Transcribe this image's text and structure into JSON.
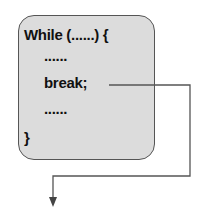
{
  "diagram": {
    "code_lines": [
      "While (......) {",
      "......",
      "break;",
      "......",
      "}"
    ],
    "colors": {
      "box_fill": "#dcdcdc",
      "box_border": "#555555",
      "arrow": "#555555"
    },
    "arrow": {
      "from": "break;",
      "to": "exit below loop"
    }
  }
}
